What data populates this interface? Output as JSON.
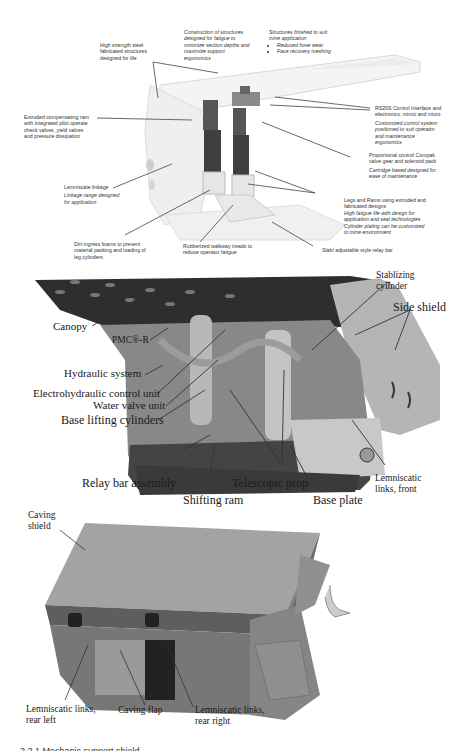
{
  "panel1": {
    "title": "Annotated roof support (upper)",
    "labels": [
      {
        "id": "high-strength",
        "lines": [
          "High strength steel",
          "fabricated structures",
          "designed for life"
        ],
        "italic_lines": []
      },
      {
        "id": "construction",
        "lines": [],
        "italic_lines": [
          "Construction of structures",
          "designed for fatigue to",
          "minimize section depths and",
          "maximize support",
          "ergonomics"
        ]
      },
      {
        "id": "finished",
        "lines": [],
        "italic_lines": [
          "Structures finished to suit",
          "mine application"
        ],
        "bullets": [
          "Reduced hose wear",
          "Face recovery meshing"
        ]
      },
      {
        "id": "extruded",
        "lines": [
          "Extruded compensating ram",
          "with integrated pilot operate",
          "check valves, yield valves",
          "and pressure dissipation"
        ],
        "italic_lines": []
      },
      {
        "id": "rs20s",
        "lines": [
          "RS20S Control Interface and",
          "electronics, mimic and micro"
        ],
        "italic_lines": [
          "Customized control system",
          "positioned to suit operator",
          "and maintenance",
          "ergonomics"
        ]
      },
      {
        "id": "proportional",
        "lines": [
          "Proportional control  Compak",
          "valve gear and solenoid pack"
        ],
        "italic_lines": [
          "Cartridge based designed  for",
          "ease of maintenance"
        ]
      },
      {
        "id": "lemniscate",
        "lines": [
          "Lemniscate linkage"
        ],
        "italic_lines": [
          "Linkage range designed",
          "for application"
        ]
      },
      {
        "id": "legs",
        "lines": [
          "Legs and Rams using extruded and",
          "fabricated designs"
        ],
        "italic_lines": [
          "High fatigue life with design for",
          "application and seal technologies",
          "Cylinder plating can be customized",
          "to mine environment"
        ]
      },
      {
        "id": "dirt",
        "lines": [
          "Dirt ingress foams to prevent",
          "material packing and loading of",
          "leg cylinders"
        ],
        "italic_lines": []
      },
      {
        "id": "rubberized",
        "lines": [
          "Rubberized walkway treads to",
          "reduce operator fatigue"
        ],
        "italic_lines": []
      },
      {
        "id": "slab",
        "lines": [
          "Slab/ adjustable style relay bar"
        ],
        "italic_lines": []
      }
    ]
  },
  "panel2": {
    "labels": {
      "canopy": "Canopy",
      "pmc": "PMC®-R",
      "hydraulic": "Hydraulic system",
      "electrohydraulic": "Electrohydraulic control unit",
      "water_valve": "Water valve unit",
      "base_lifting": "Base lifting cylinders",
      "relay_bar": "Relay bar assembly",
      "shifting_ram": "Shifting ram",
      "telescopic": "Telescopic prop",
      "base_plate": "Base plate",
      "lemniscatic_front_1": "Lemniscatic",
      "lemniscatic_front_2": "links, front",
      "stabilizing_1": "Stablizing",
      "stabilizing_2": "cylinder",
      "side_shield": "Side shield"
    }
  },
  "panel3": {
    "labels": {
      "caving_shield_1": "Caving",
      "caving_shield_2": "shield",
      "rear_left_1": "Lemniscatic links,",
      "rear_left_2": "rear left",
      "caving_flap": "Caving flap",
      "rear_right_1": "Lemniscatic links,",
      "rear_right_2": "rear right"
    }
  },
  "caption": "2.2.1 Mechanic support shield"
}
